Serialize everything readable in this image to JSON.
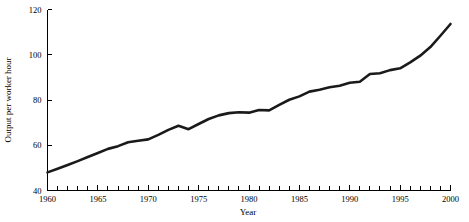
{
  "chart_data": {
    "type": "line",
    "title": "",
    "xlabel": "Year",
    "ylabel": "Output per worker hour",
    "xlim": [
      1960,
      2000
    ],
    "ylim": [
      40,
      120
    ],
    "grid": false,
    "legend": "none",
    "line_color": "#1a1a1a",
    "x_tick_labels": [
      "1960",
      "1965",
      "1970",
      "1975",
      "1980",
      "1985",
      "1990",
      "1995",
      "2000"
    ],
    "x_tick_values": [
      1960,
      1965,
      1970,
      1975,
      1980,
      1985,
      1990,
      1995,
      2000
    ],
    "x_minor_tick_step": 1,
    "y_tick_labels": [
      "40",
      "60",
      "80",
      "100",
      "120"
    ],
    "y_tick_values": [
      40,
      60,
      80,
      100,
      120
    ],
    "series": [
      {
        "name": "Output per worker hour",
        "x": [
          1960,
          1961,
          1962,
          1963,
          1964,
          1965,
          1966,
          1967,
          1968,
          1969,
          1970,
          1971,
          1972,
          1973,
          1974,
          1975,
          1976,
          1977,
          1978,
          1979,
          1980,
          1981,
          1982,
          1983,
          1984,
          1985,
          1986,
          1987,
          1988,
          1989,
          1990,
          1991,
          1992,
          1993,
          1994,
          1995,
          1996,
          1997,
          1998,
          1999,
          2000
        ],
        "values": [
          48.0,
          49.6,
          51.3,
          53.0,
          54.8,
          56.6,
          58.4,
          59.6,
          61.3,
          62.0,
          62.6,
          64.6,
          66.8,
          68.6,
          67.1,
          69.4,
          71.6,
          73.2,
          74.2,
          74.6,
          74.4,
          75.6,
          75.4,
          77.8,
          80.1,
          81.6,
          83.7,
          84.5,
          85.6,
          86.3,
          87.6,
          88.1,
          91.5,
          91.8,
          93.2,
          94.0,
          96.6,
          99.6,
          103.4,
          108.4,
          113.6
        ]
      }
    ]
  }
}
